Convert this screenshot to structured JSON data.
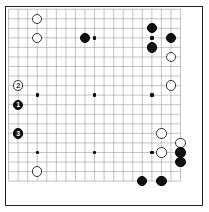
{
  "board": {
    "title": "Go board diagram",
    "size": 19,
    "line_color": "#9a9a9a",
    "border_color": "#222222",
    "background_color": "#ffffff",
    "black_color": "#111111",
    "white_color": "#ffffff",
    "origin_x": 8.6,
    "origin_y": 9.2,
    "spacing": 9.55,
    "stone_radius": 5.2,
    "hoshi": [
      {
        "col": 3,
        "row": 3
      },
      {
        "col": 9,
        "row": 3
      },
      {
        "col": 15,
        "row": 3
      },
      {
        "col": 3,
        "row": 9
      },
      {
        "col": 9,
        "row": 9
      },
      {
        "col": 15,
        "row": 9
      },
      {
        "col": 3,
        "row": 15
      },
      {
        "col": 9,
        "row": 15
      },
      {
        "col": 15,
        "row": 15
      }
    ],
    "stones": [
      {
        "col": 3,
        "row": 1,
        "color": "white",
        "label": ""
      },
      {
        "col": 3,
        "row": 3,
        "color": "white",
        "label": ""
      },
      {
        "col": 8,
        "row": 3,
        "color": "black",
        "label": ""
      },
      {
        "col": 15,
        "row": 2,
        "color": "black",
        "label": ""
      },
      {
        "col": 17,
        "row": 3,
        "color": "black",
        "label": ""
      },
      {
        "col": 15,
        "row": 4,
        "color": "black",
        "label": ""
      },
      {
        "col": 17,
        "row": 5,
        "color": "white",
        "label": ""
      },
      {
        "col": 1,
        "row": 8,
        "color": "white",
        "label": "2"
      },
      {
        "col": 17,
        "row": 8,
        "color": "white",
        "label": ""
      },
      {
        "col": 1,
        "row": 10,
        "color": "black",
        "label": "1"
      },
      {
        "col": 1,
        "row": 13,
        "color": "black",
        "label": "3"
      },
      {
        "col": 16,
        "row": 13,
        "color": "white",
        "label": ""
      },
      {
        "col": 18,
        "row": 14,
        "color": "white",
        "label": ""
      },
      {
        "col": 16,
        "row": 15,
        "color": "white",
        "label": ""
      },
      {
        "col": 18,
        "row": 15,
        "color": "black",
        "label": ""
      },
      {
        "col": 18,
        "row": 16,
        "color": "black",
        "label": ""
      },
      {
        "col": 3,
        "row": 17,
        "color": "white",
        "label": ""
      },
      {
        "col": 14,
        "row": 18,
        "color": "black",
        "label": ""
      },
      {
        "col": 16,
        "row": 18,
        "color": "black",
        "label": ""
      }
    ]
  }
}
